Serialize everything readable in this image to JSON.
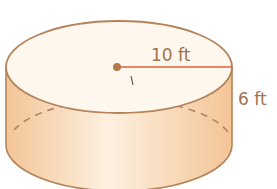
{
  "figure": {
    "shape": "cylinder",
    "radius_label": "10 ft",
    "height_label": "6 ft",
    "colors": {
      "fill_side": "#f6cfa3",
      "fill_side_light": "#fdeedb",
      "fill_top": "#fdf7ee",
      "outline": "#b5835a",
      "radius_line": "#e0603a",
      "center_dot": "#b5784a",
      "label": "#a0724e"
    }
  }
}
